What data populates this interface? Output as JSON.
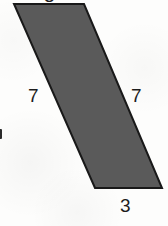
{
  "figure": {
    "kind": "parallelogram",
    "background_color": "#fdfdfc",
    "fill_color": "#5a5a5a",
    "stroke_color": "#191919",
    "stroke_width": 2,
    "vertices": [
      {
        "name": "top-left",
        "x": 14,
        "y": 4
      },
      {
        "name": "top-right",
        "x": 84,
        "y": 4
      },
      {
        "name": "bottom-right",
        "x": 162,
        "y": 188
      },
      {
        "name": "bottom-left",
        "x": 95,
        "y": 188
      }
    ],
    "polygon_points": "14,4 84,4 162,188 95,188",
    "labels": {
      "left_side": "7",
      "right_side": "7",
      "bottom_side": "3",
      "top_side_cropped": "3"
    }
  }
}
